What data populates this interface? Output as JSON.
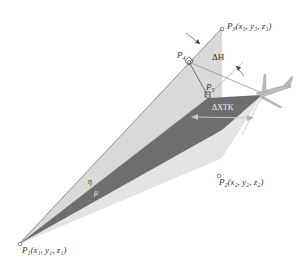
{
  "diagram": {
    "points": {
      "p1": {
        "label": "P",
        "sub": "1",
        "coords": "(x₁, y₁, z₁)"
      },
      "p2": {
        "label": "P",
        "sub": "2",
        "coords": "(x₂, y₂, z₂)"
      },
      "p3": {
        "label": "P",
        "sub": "3",
        "coords": "(x₃, y₃, z₃)"
      },
      "p4": {
        "label": "P",
        "sub": "4"
      },
      "p5": {
        "label": "P",
        "sub": "5"
      }
    },
    "annotations": {
      "delta_h": "ΔH",
      "delta_xtk": "ΔXTK",
      "eta": "η",
      "mu": "μ"
    },
    "colors": {
      "light_plane": "#d6d6d6",
      "lighter_plane": "#e6e6e6",
      "dark_band": "#6b6b6b",
      "line": "#7a7a7a",
      "text": "#333333"
    }
  }
}
